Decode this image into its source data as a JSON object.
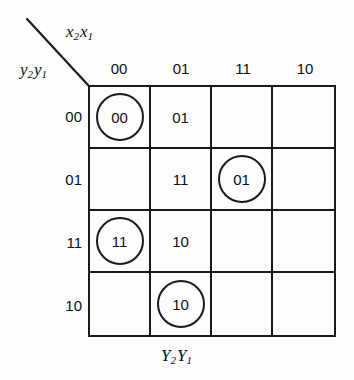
{
  "diagram": {
    "type": "karnaugh-map",
    "column_axis_label": "x2x1",
    "column_axis_var1": "x",
    "column_axis_sub1": "2",
    "column_axis_var2": "x",
    "column_axis_sub2": "1",
    "row_axis_var1": "y",
    "row_axis_sub1": "2",
    "row_axis_var2": "y",
    "row_axis_sub2": "1",
    "bottom_label_var1": "Y",
    "bottom_label_sub1": "2",
    "bottom_label_var2": "Y",
    "bottom_label_sub2": "1",
    "column_headers": [
      "00",
      "01",
      "11",
      "10"
    ],
    "row_headers": [
      "00",
      "01",
      "11",
      "10"
    ],
    "cells": [
      [
        {
          "value": "00",
          "circled": true
        },
        {
          "value": "01",
          "circled": false
        },
        {
          "value": "",
          "circled": false
        },
        {
          "value": "",
          "circled": false
        }
      ],
      [
        {
          "value": "",
          "circled": false
        },
        {
          "value": "11",
          "circled": false
        },
        {
          "value": "01",
          "circled": true
        },
        {
          "value": "",
          "circled": false
        }
      ],
      [
        {
          "value": "11",
          "circled": true
        },
        {
          "value": "10",
          "circled": false
        },
        {
          "value": "",
          "circled": false
        },
        {
          "value": "",
          "circled": false
        }
      ],
      [
        {
          "value": "",
          "circled": false
        },
        {
          "value": "10",
          "circled": true
        },
        {
          "value": "",
          "circled": false
        },
        {
          "value": "",
          "circled": false
        }
      ]
    ],
    "colors": {
      "line": "#1a1a1a",
      "text": "#111111",
      "background": "#fdfdfb"
    }
  }
}
